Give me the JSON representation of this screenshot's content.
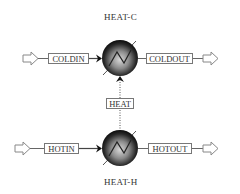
{
  "diagram": {
    "blocks": [
      {
        "id": "heat-c",
        "label": "HEAT-C",
        "type": "heater"
      },
      {
        "id": "heat-h",
        "label": "HEAT-H",
        "type": "heater"
      }
    ],
    "streams": {
      "coldin": "COLDIN",
      "coldout": "COLDOUT",
      "heat": "HEAT",
      "hotin": "HOTIN",
      "hotout": "HOTOUT"
    },
    "colors": {
      "line": "#555555",
      "box_border": "#777777",
      "block_dark": "#111111",
      "block_light": "#bbbbbb"
    }
  }
}
